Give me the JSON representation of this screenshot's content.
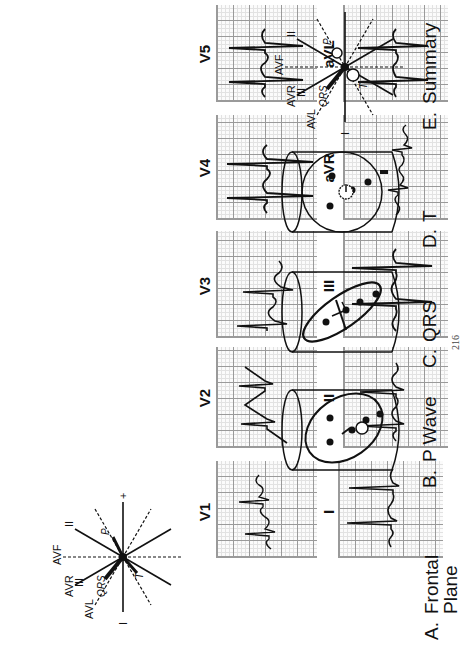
{
  "ecg": {
    "limb_leads": [
      {
        "label": "I"
      },
      {
        "label": "II"
      },
      {
        "label": "III"
      },
      {
        "label": "aVR"
      },
      {
        "label": "aVL"
      },
      {
        "label": "aVF"
      }
    ],
    "precordial_leads": [
      {
        "label": "V1"
      },
      {
        "label": "V2"
      },
      {
        "label": "V3"
      },
      {
        "label": "V4"
      },
      {
        "label": "V5"
      },
      {
        "label": "V6"
      }
    ]
  },
  "panels": {
    "a": {
      "letter": "A.",
      "title_line1": "Frontal",
      "title_line2": "Plane"
    },
    "b": {
      "letter": "B.",
      "title": "P Wave"
    },
    "c": {
      "letter": "C.",
      "title": "QRS"
    },
    "d": {
      "letter": "D.",
      "title": "T"
    },
    "e": {
      "letter": "E.",
      "title": "Summary"
    }
  },
  "axis_labels": {
    "lead_I": "I",
    "lead_II": "II",
    "lead_III": "III",
    "aVR": "AVR",
    "aVL": "AVL",
    "aVF": "AVF",
    "plus": "+",
    "vector_qrs": "QRS",
    "vector_t": "T",
    "vector_p": "P"
  },
  "page_number": "216"
}
